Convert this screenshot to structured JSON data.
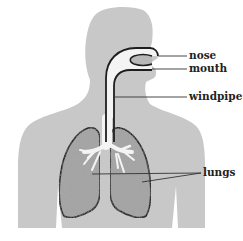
{
  "diagram": {
    "type": "anatomy",
    "labels": [
      {
        "id": "nose",
        "text": "nose"
      },
      {
        "id": "mouth",
        "text": "mouth"
      },
      {
        "id": "windpipe",
        "text": "windpipe"
      },
      {
        "id": "lungs",
        "text": "lungs"
      }
    ],
    "colors": {
      "body": "#c8c8c8",
      "lungs": "#a6a6a6",
      "airway": "#f4f4f4",
      "outline": "#1e1e1e",
      "leader_line": "#333333"
    }
  }
}
